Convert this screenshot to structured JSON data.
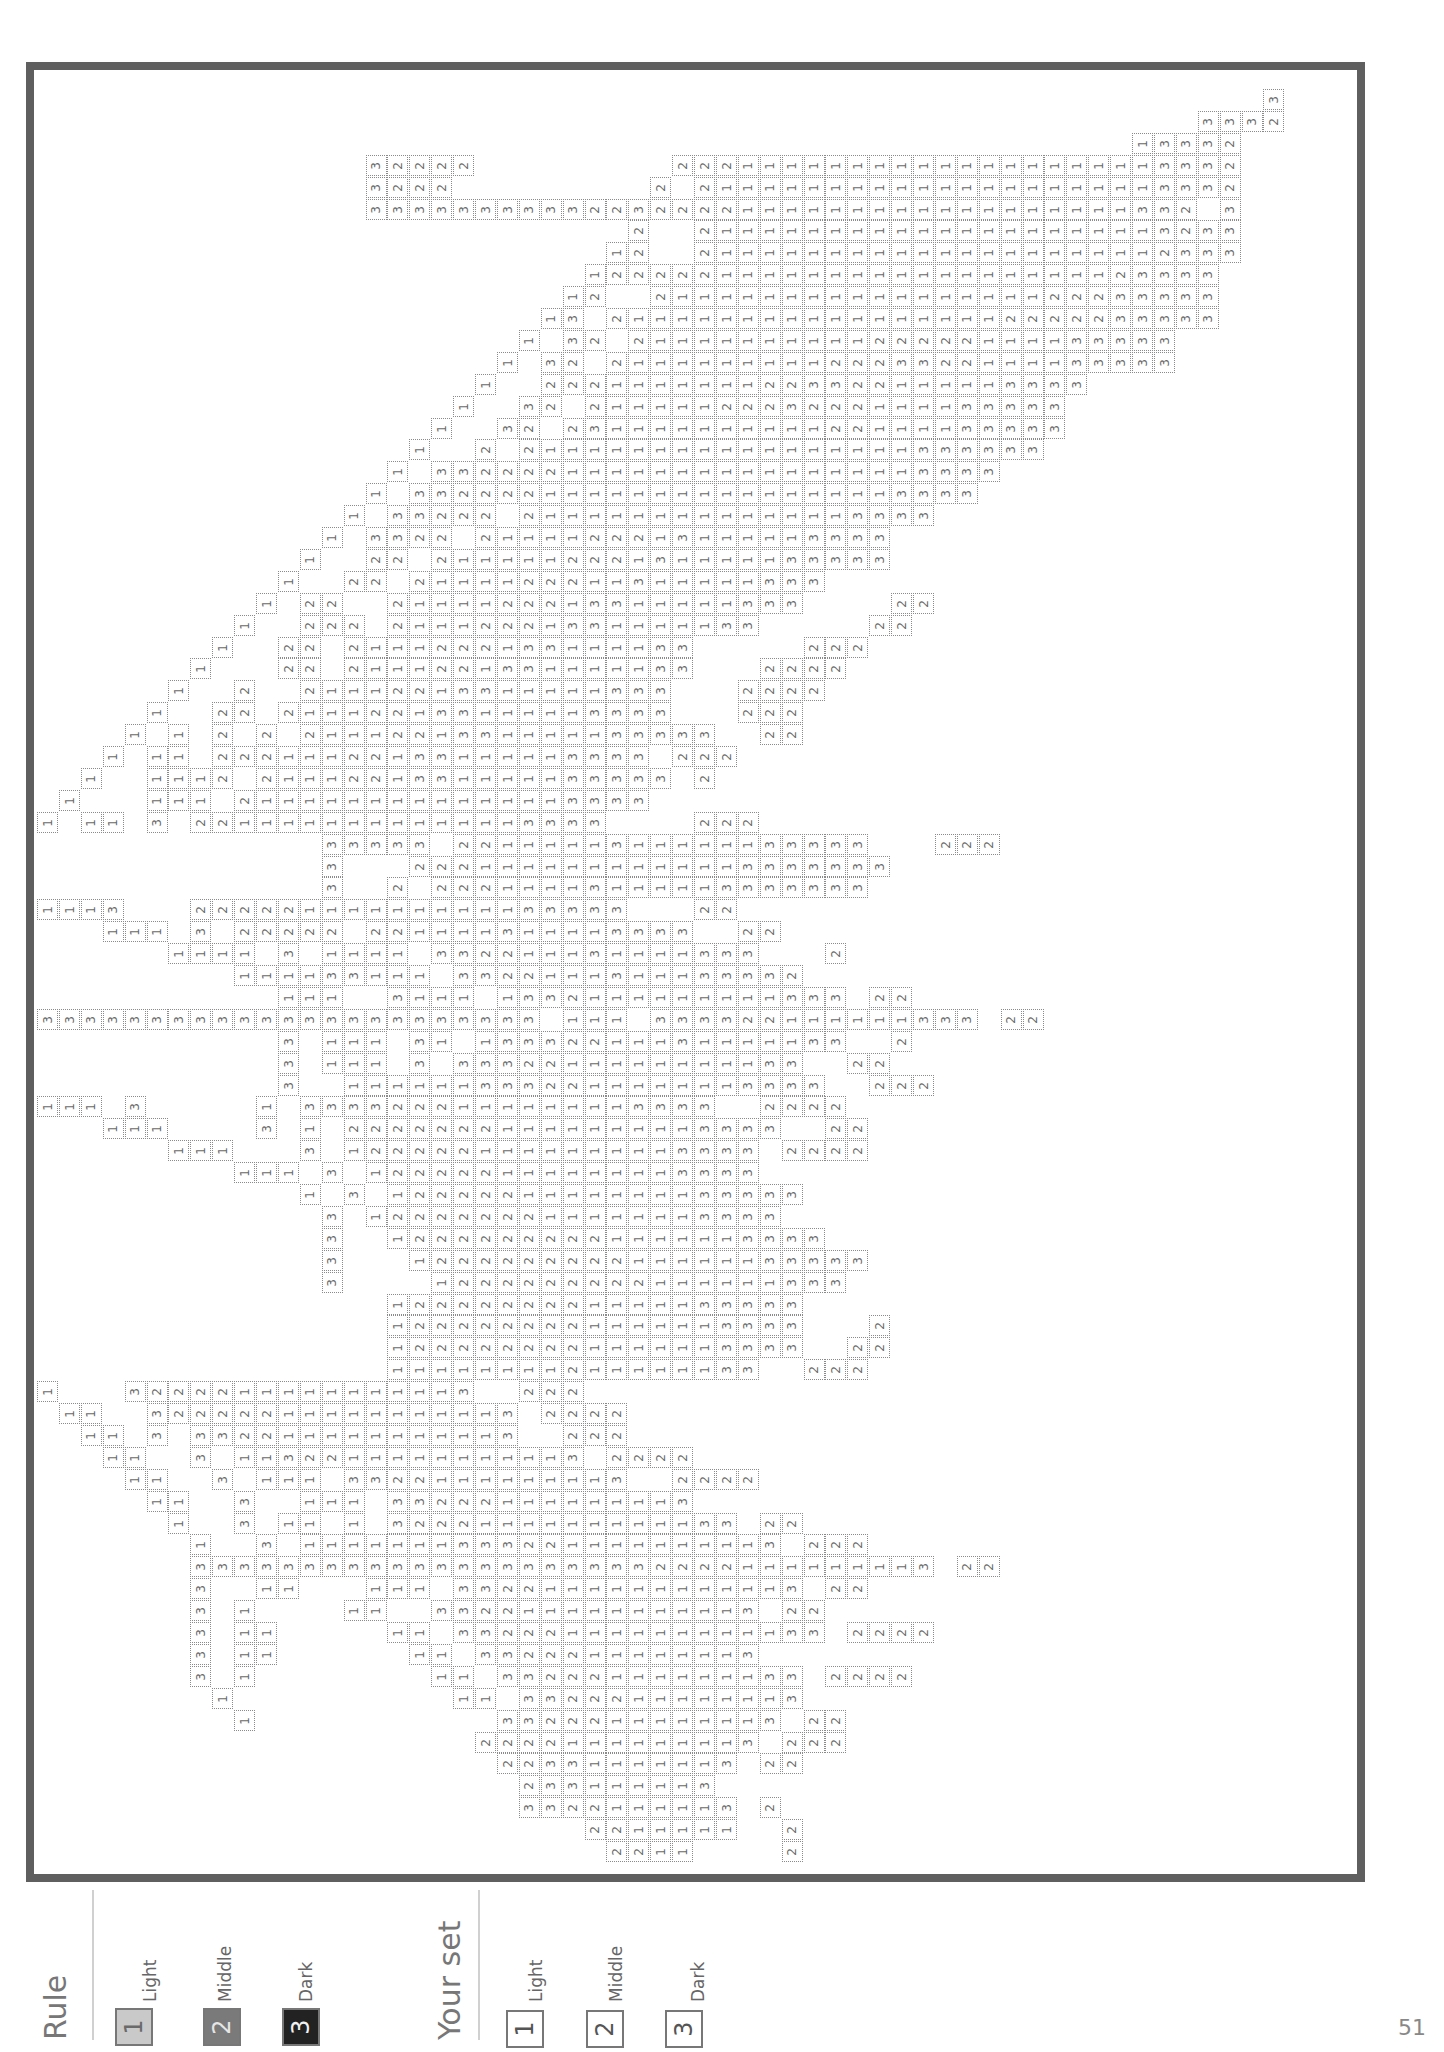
{
  "page": {
    "number": "51"
  },
  "legend": {
    "rule": {
      "title": "Rule",
      "items": [
        {
          "num": "1",
          "label": "Light",
          "color": "#c9c9c9",
          "text_color": "#6a6a6a"
        },
        {
          "num": "2",
          "label": "Middle",
          "color": "#7a7a7a",
          "text_color": "#e5e5e5"
        },
        {
          "num": "3",
          "label": "Dark",
          "color": "#222222",
          "text_color": "#f0f0f0"
        }
      ]
    },
    "your_set": {
      "title": "Your set",
      "items": [
        {
          "num": "1",
          "label": "Light"
        },
        {
          "num": "2",
          "label": "Middle"
        },
        {
          "num": "3",
          "label": "Dark"
        }
      ]
    }
  },
  "puzzle": {
    "cell_size": 21.9,
    "columns": 57,
    "rows": 81,
    "runs": [
      [
        0,
        56,
        "3"
      ],
      [
        1,
        53,
        "3332"
      ],
      [
        2,
        50,
        "13332"
      ],
      [
        3,
        15,
        "32222"
      ],
      [
        3,
        29,
        "22211111111111111111113332"
      ],
      [
        4,
        15,
        "3222"
      ],
      [
        4,
        28,
        "2 2111111111111111111113332"
      ],
      [
        5,
        15,
        "3333333333222"
      ],
      [
        5,
        27,
        "32222111111111111111111332 3"
      ],
      [
        6,
        27,
        "2  2111111111111111111113233"
      ],
      [
        7,
        26,
        "12  2111111111111111111112333"
      ],
      [
        8,
        25,
        "12222211111111111111111123333"
      ],
      [
        9,
        24,
        "12  21111111111111111122233333"
      ],
      [
        10,
        23,
        "13 2111111111111111112222233333"
      ],
      [
        11,
        22,
        "1 32 2111111111122222111133333"
      ],
      [
        12,
        21,
        "1 32 21111111112223322111133333"
      ],
      [
        13,
        20,
        "1  2221111111223322111113333"
      ],
      [
        14,
        19,
        "1  32 2111112223222111133333"
      ],
      [
        15,
        18,
        "1  32 23111111111122111133333"
      ],
      [
        16,
        17,
        "1  2 211111111111111111333333"
      ],
      [
        17,
        16,
        "1 33222211111111111111113333"
      ],
      [
        18,
        15,
        "1 33222211111111111111113333"
      ],
      [
        19,
        14,
        "1 33222 2111111111111113333"
      ],
      [
        20,
        13,
        "1 3322 2111122213111113333"
      ],
      [
        21,
        12,
        "1  22 211111222131111133333"
      ],
      [
        22,
        11,
        "1  22 2111122211311111333"
      ],
      [
        23,
        10,
        "1 22  2111122213311111333    22"
      ],
      [
        24,
        9,
        "1  222 21112221331111133     22"
      ],
      [
        25,
        8,
        "1  22 2111222133111133     222"
      ],
      [
        26,
        7,
        "1   22 2111221331111133   2222"
      ],
      [
        27,
        6,
        "1  2  21112213311111333   2222"
      ],
      [
        28,
        5,
        "1  22 211122133111113333   222"
      ],
      [
        29,
        4,
        "1 1 2 2 2111221331111133333  22"
      ],
      [
        30,
        3,
        "1 11 22211122133111113333 222"
      ],
      [
        31,
        2,
        "1  1112 2111221331111133333 2"
      ],
      [
        32,
        1,
        "1   111 2111111111111113333"
      ],
      [
        33,
        0,
        "1 11 3 2211111111111113333    222"
      ],
      [
        34,
        13,
        "33333 2211111311111133333   222"
      ],
      [
        35,
        13,
        "3   2221111111111113333333"
      ],
      [
        36,
        13,
        "3  2 22211113111113333333"
      ],
      [
        37,
        0,
        "1113   22222111111111133333   22"
      ],
      [
        38,
        3,
        "111 3 22222 221111311113333  22"
      ],
      [
        39,
        6,
        "1111 3 1111 332211131111333   2"
      ],
      [
        40,
        9,
        "111133111 3322111311133332"
      ],
      [
        41,
        11,
        "111  3111 1332111111111333 22"
      ],
      [
        42,
        0,
        "33333333333333333333333 111 333322111111333 22"
      ],
      [
        43,
        11,
        "3 111 31 13332211131111133  2"
      ],
      [
        44,
        11,
        "3 111 3 3332211111111133  22"
      ],
      [
        45,
        11,
        "3  1111113332211111113333  222"
      ],
      [
        46,
        0,
        "111 3     1 3333222111111113333  2222"
      ],
      [
        47,
        3,
        "111    3 1 22222221111111113333  22"
      ],
      [
        48,
        6,
        "111   3 1222221111111113333 2222"
      ],
      [
        49,
        9,
        "111 3 122222111111113333"
      ],
      [
        50,
        12,
        "1 3 1222221111111133333"
      ],
      [
        51,
        13,
        "3 1222222211111113333"
      ],
      [
        52,
        13,
        "3  12222222221111113333"
      ],
      [
        53,
        13,
        "3   122222222211111133333"
      ],
      [
        54,
        13,
        "3    1222222222111111333"
      ],
      [
        55,
        16,
        "1222222221111133333"
      ],
      [
        56,
        16,
        "1222222221111113333   2"
      ],
      [
        57,
        16,
        "1222222221111113333  22"
      ],
      [
        58,
        16,
        "11111111211111133  222"
      ],
      [
        59,
        0,
        "1   3222211111111113  222"
      ],
      [
        60,
        1,
        "11  32222211111111113 2222"
      ],
      [
        61,
        2,
        "11 3 332211111111113  222"
      ],
      [
        62,
        3,
        "11  3 1132211111111113 2222"
      ],
      [
        63,
        4,
        "11  3 111 3322111111113  2222"
      ],
      [
        64,
        5,
        "11  3  111 33222111111113"
      ],
      [
        65,
        6,
        "1  3 11 1 3222111111111133 22"
      ],
      [
        66,
        7,
        "1  3 1111111333221111111113 222"
      ],
      [
        67,
        7,
        "3333333333333333333332222111111113 22"
      ],
      [
        68,
        7,
        "3  11   111 3322111111111113 22"
      ],
      [
        69,
        7,
        "3 1    11  332211111111113 22"
      ],
      [
        70,
        7,
        "3 11     11 33222111111111133 2222"
      ],
      [
        71,
        7,
        "3 11      11 3322211111113"
      ],
      [
        72,
        7,
        "3 1        11 33222111111133 2222"
      ],
      [
        73,
        8,
        "1          11 3322211111113"
      ],
      [
        74,
        9,
        "1           3322211111113 22"
      ],
      [
        75,
        20,
        "2222111111113 222"
      ],
      [
        76,
        21,
        "22331111113 22"
      ],
      [
        77,
        22,
        "233111113"
      ],
      [
        78,
        22,
        "3322111113 2"
      ],
      [
        79,
        25,
        "2211111  2"
      ],
      [
        80,
        26,
        "2211    2"
      ]
    ]
  }
}
